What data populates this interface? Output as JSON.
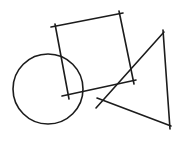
{
  "canvas": {
    "width": 181,
    "height": 141,
    "background": "#ffffff",
    "stroke_color": "#1c1c1c",
    "stroke_width": 1.6
  },
  "shapes": {
    "circle": {
      "cx": 48,
      "cy": 89,
      "r": 35
    },
    "square": {
      "edges": [
        {
          "x1": 51,
          "y1": 27,
          "x2": 123,
          "y2": 13
        },
        {
          "x1": 119,
          "y1": 11,
          "x2": 134,
          "y2": 84
        },
        {
          "x1": 136,
          "y1": 80,
          "x2": 62,
          "y2": 96
        },
        {
          "x1": 69,
          "y1": 99,
          "x2": 55,
          "y2": 24
        }
      ]
    },
    "triangle": {
      "edges": [
        {
          "x1": 163,
          "y1": 30,
          "x2": 170,
          "y2": 129
        },
        {
          "x1": 171,
          "y1": 126,
          "x2": 97,
          "y2": 98
        },
        {
          "x1": 96,
          "y1": 108,
          "x2": 164,
          "y2": 32
        }
      ]
    }
  }
}
